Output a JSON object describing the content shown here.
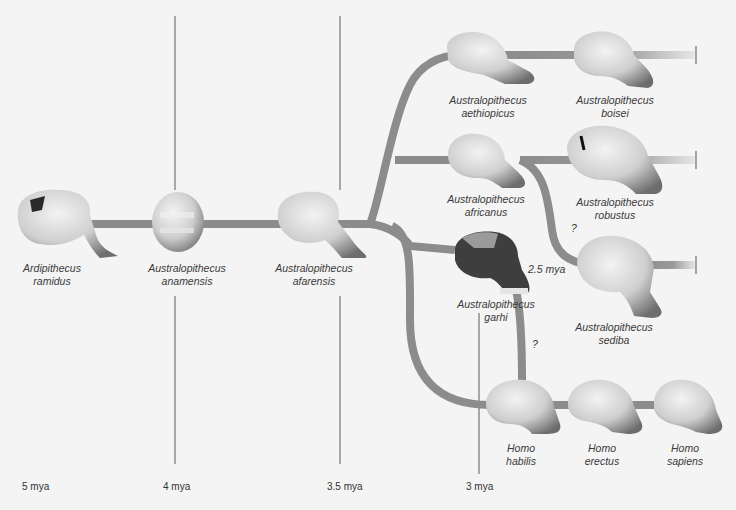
{
  "colors": {
    "background": "#f4f4f4",
    "branch": "#8c8c8c",
    "time_line": "#555555",
    "skull_light": "#dedede",
    "skull_shadow": "#6f6f6f",
    "garhi_dark": "#3c3c3c"
  },
  "timeline": {
    "ticks": [
      {
        "label": "5 mya",
        "x": 22
      },
      {
        "label": "4 mya",
        "x": 163
      },
      {
        "label": "3.5 mya",
        "x": 327
      },
      {
        "label": "3 mya",
        "x": 466
      }
    ]
  },
  "species": [
    {
      "genus": "Ardipithecus",
      "species": "ramidus",
      "x": 52,
      "y": 262
    },
    {
      "genus": "Australopithecus",
      "species": "anamensis",
      "x": 187,
      "y": 262
    },
    {
      "genus": "Australopithecus",
      "species": "afarensis",
      "x": 314,
      "y": 262
    },
    {
      "genus": "Australopithecus",
      "species": "aethiopicus",
      "x": 488,
      "y": 94
    },
    {
      "genus": "Australopithecus",
      "species": "boisei",
      "x": 615,
      "y": 94
    },
    {
      "genus": "Australopithecus",
      "species": "africanus",
      "x": 486,
      "y": 193
    },
    {
      "genus": "Australopithecus",
      "species": "robustus",
      "x": 615,
      "y": 196
    },
    {
      "genus": "Australopithecus",
      "species": "garhi",
      "x": 496,
      "y": 298
    },
    {
      "genus": "Australopithecus",
      "species": "sediba",
      "x": 614,
      "y": 321
    },
    {
      "genus": "Homo",
      "species": "habilis",
      "x": 521,
      "y": 442
    },
    {
      "genus": "Homo",
      "species": "erectus",
      "x": 602,
      "y": 442
    },
    {
      "genus": "Homo",
      "species": "sapiens",
      "x": 685,
      "y": 442
    }
  ],
  "annotations": [
    {
      "text": "2.5 mya",
      "x": 528,
      "y": 270
    },
    {
      "text": "?",
      "x": 571,
      "y": 222
    },
    {
      "text": "?",
      "x": 532,
      "y": 338
    }
  ]
}
